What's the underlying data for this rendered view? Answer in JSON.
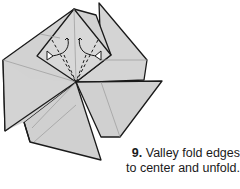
{
  "figure": {
    "step_number": "9.",
    "caption_line1": "Valley fold edges",
    "caption_line2": "to center and unfold."
  },
  "colors": {
    "paper": "#cfcfcf",
    "paper_light": "#dadada",
    "line": "#1a1a1a",
    "crease": "#9a9a9a",
    "background": "#ffffff"
  }
}
